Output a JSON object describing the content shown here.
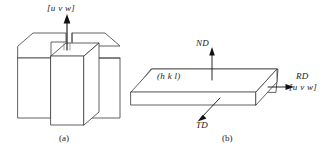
{
  "figure": {
    "panels": [
      {
        "caption": "(a)",
        "description": "polycrystal-cube-with-grain",
        "labels": {
          "direction": "[u v w]"
        }
      },
      {
        "caption": "(b)",
        "description": "rolled-sheet-slab",
        "labels": {
          "normal_direction": "ND",
          "transverse_direction": "TD",
          "rolling_direction": "RD",
          "plane": "(h k l)",
          "direction": "[u v w]"
        }
      }
    ],
    "colors": {
      "stroke": "#3a3a3a",
      "fill": "#ffffff",
      "arrow": "#111111",
      "text": "#1a1a1a",
      "background": "#ffffff"
    }
  }
}
